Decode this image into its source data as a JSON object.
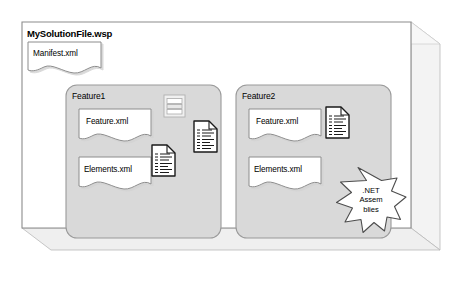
{
  "diagram": {
    "type": "package-cube-diagram",
    "title": "MySolutionFile.wsp",
    "outer_container": {
      "name": "MySolutionFile.wsp",
      "shape": "3d-box",
      "face_fill": "#ffffff",
      "face_stroke": "#808080",
      "side_fill": "#f2f2f2",
      "bottom_fill": "#ededed"
    },
    "loose_documents": [
      {
        "label": "Manifest.xml",
        "shape": "wavy-document"
      }
    ],
    "groups": [
      {
        "label": "Feature1",
        "shape": "rounded-rect",
        "fill": "#d9d9d9",
        "stroke": "#9a9a9a",
        "documents": [
          {
            "label": "Feature.xml",
            "shape": "wavy-document"
          },
          {
            "label": "Elements.xml",
            "shape": "wavy-document"
          }
        ],
        "icons": [
          {
            "name": "resource-grid-icon",
            "style": "light-gray-banded-page"
          },
          {
            "name": "xml-document-icon",
            "style": "folded-corner-text-page"
          },
          {
            "name": "xml-document-icon",
            "style": "folded-corner-text-page"
          }
        ]
      },
      {
        "label": "Feature2",
        "shape": "rounded-rect",
        "fill": "#d9d9d9",
        "stroke": "#9a9a9a",
        "documents": [
          {
            "label": "Feature.xml",
            "shape": "wavy-document"
          },
          {
            "label": "Elements.xml",
            "shape": "wavy-document"
          }
        ],
        "icons": [
          {
            "name": "xml-document-icon",
            "style": "folded-corner-text-page"
          }
        ],
        "burst": {
          "shape": "7-point-star",
          "lines": [
            ".NET",
            "Assem",
            "blies"
          ],
          "fill": "#ffffff",
          "stroke": "#4d4d4d"
        }
      }
    ],
    "colors": {
      "text": "#000000",
      "frame_stroke": "#8c8c8c",
      "group_fill": "#d9d9d9",
      "group_stroke": "#9a9a9a",
      "doc_fill": "#ffffff",
      "doc_stroke": "#8c8c8c",
      "icon_stroke": "#1a1a1a",
      "depth_fill": "#f0f0f0"
    }
  }
}
